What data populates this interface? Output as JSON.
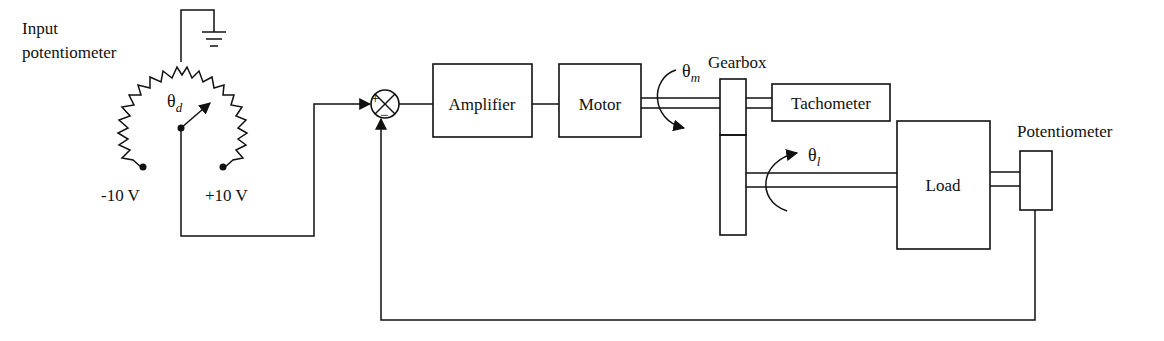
{
  "diagram": {
    "type": "position-control-system-schematic",
    "blocks": {
      "amplifier": "Amplifier",
      "motor": "Motor",
      "tachometer": "Tachometer",
      "load": "Load"
    },
    "labels": {
      "input_pot_line1": "Input",
      "input_pot_line2": "potentiometer",
      "neg_voltage": "-10 V",
      "pos_voltage": "+10 V",
      "gearbox": "Gearbox",
      "potentiometer": "Potentiometer"
    },
    "symbols": {
      "theta": "θ",
      "theta_d_sub": "d",
      "theta_m_sub": "m",
      "theta_l_sub": "l",
      "plus": "+",
      "minus": "−"
    },
    "colors": {
      "ink": "#111111",
      "background": "#ffffff"
    }
  }
}
